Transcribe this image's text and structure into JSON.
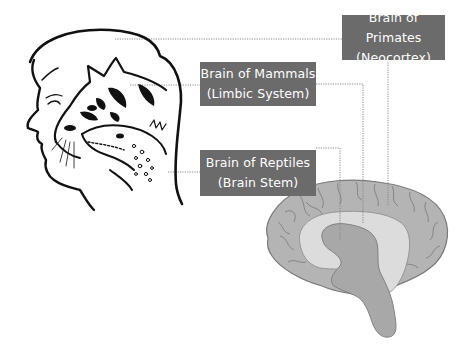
{
  "diagram": {
    "labels": [
      {
        "id": "primates",
        "line1": "Brain of Primates",
        "line2": "(Neocortex)"
      },
      {
        "id": "mammals",
        "line1": "Brain of Mammals",
        "line2": "(Limbic System)"
      },
      {
        "id": "reptiles",
        "line1": "Brain of Reptiles",
        "line2": "(Brain Stem)"
      }
    ],
    "illustrations": {
      "left": "human-head-profile-with-cat-and-lizard-heads",
      "right": "brain-sagittal-section"
    },
    "colors": {
      "label_box": "#6b6b6b",
      "label_text": "#ffffff",
      "neocortex": "#b4b4b4",
      "limbic": "#dcdcdc",
      "brainstem": "#a8a8a8",
      "outline": "#7a7a7a",
      "leader_line": "#888888",
      "ink": "#111111"
    }
  }
}
